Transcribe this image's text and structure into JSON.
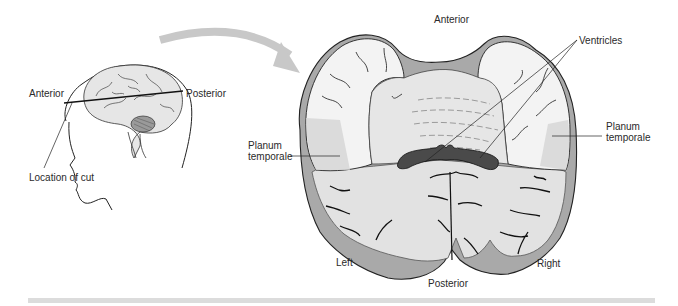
{
  "figure": {
    "head_diagram": {
      "labels": {
        "anterior": "Anterior",
        "posterior": "Posterior",
        "location_of_cut": "Location of cut"
      }
    },
    "section_diagram": {
      "labels": {
        "anterior": "Anterior",
        "posterior": "Posterior",
        "left": "Left",
        "right": "Right",
        "ventricles": "Ventricles",
        "planum_left_line1": "Planum",
        "planum_left_line2": "temporale",
        "planum_right_line1": "Planum",
        "planum_right_line2": "temporale"
      }
    },
    "colors": {
      "arrow": "#c8c8c8",
      "white_matter": "#e4e4e4",
      "gray_matter": "#a9a9a9",
      "cortex_surface": "#f2f2f2",
      "ventricle": "#4a4a4a",
      "outline": "#222222",
      "bottom_bar": "#dcdcdc"
    }
  }
}
